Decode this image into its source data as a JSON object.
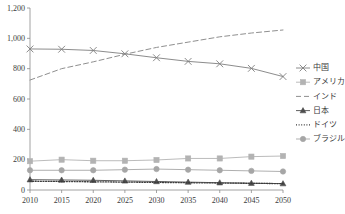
{
  "chart_data": {
    "type": "line",
    "title": "",
    "subtitle": "",
    "xlabel": "",
    "ylabel": "",
    "x": [
      2010,
      2015,
      2020,
      2025,
      2030,
      2035,
      2040,
      2045,
      2050
    ],
    "xtick_labels": [
      "2010",
      "2015",
      "2020",
      "2025",
      "2030",
      "2035",
      "2040",
      "2045",
      "2050"
    ],
    "ytick_labels": [
      "0",
      "200",
      "400",
      "600",
      "800",
      "1,000",
      "1,200"
    ],
    "yticks": [
      0,
      200,
      400,
      600,
      800,
      1000,
      1200
    ],
    "ylim": [
      0,
      1200
    ],
    "xlim": [
      2010,
      2050
    ],
    "grid": false,
    "legend_position": "right",
    "series": [
      {
        "name": "中国",
        "marker": "x-cross",
        "dash": "solid",
        "color": "#7f7f7f",
        "values": [
          930,
          928,
          920,
          898,
          872,
          848,
          832,
          802,
          748
        ]
      },
      {
        "name": "アメリカ",
        "marker": "square",
        "dash": "solid",
        "color": "#b3b3b3",
        "values": [
          190,
          200,
          193,
          193,
          198,
          208,
          208,
          220,
          224
        ]
      },
      {
        "name": "インド",
        "marker": "none",
        "dash": "dashed",
        "color": "#8f8f8f",
        "values": [
          725,
          800,
          845,
          895,
          940,
          975,
          1010,
          1035,
          1055
        ]
      },
      {
        "name": "日本",
        "marker": "triangle",
        "dash": "solid",
        "color": "#4d4d4d",
        "values": [
          68,
          66,
          64,
          60,
          56,
          52,
          48,
          45,
          42
        ]
      },
      {
        "name": "ドイツ",
        "marker": "none",
        "dash": "dotted",
        "color": "#3a3a3a",
        "values": [
          58,
          56,
          54,
          52,
          50,
          48,
          46,
          44,
          42
        ]
      },
      {
        "name": "ブラジル",
        "marker": "circle",
        "dash": "solid",
        "color": "#a6a6a6",
        "values": [
          130,
          130,
          130,
          134,
          138,
          134,
          130,
          126,
          122
        ]
      }
    ]
  },
  "legend": {
    "items": [
      {
        "label": "中国"
      },
      {
        "label": "アメリカ"
      },
      {
        "label": "インド"
      },
      {
        "label": "日本"
      },
      {
        "label": "ドイツ"
      },
      {
        "label": "ブラジル"
      }
    ]
  }
}
